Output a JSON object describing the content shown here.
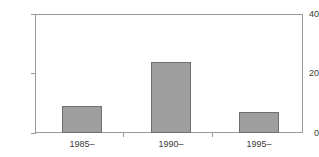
{
  "chart_data": {
    "type": "bar",
    "title": "",
    "subtitle": "",
    "xlabel": "",
    "ylabel": "",
    "categories": [
      "1985–",
      "1990–",
      "1995–"
    ],
    "values": [
      9,
      24,
      7
    ],
    "ylim": [
      0,
      40
    ],
    "yticks": [
      0,
      20,
      40
    ],
    "ytick_labels": [
      "0",
      "20",
      "40"
    ],
    "grid": false,
    "legend": null,
    "legend_position": "none",
    "series": [
      {
        "name": "",
        "values": [
          9,
          24,
          7
        ]
      }
    ],
    "colors": {
      "bar_fill": "#9e9e9e",
      "bar_edge": "#6f6f6f",
      "axis": "#9a9a9a",
      "text": "#3a3a3a",
      "background": "#ffffff"
    }
  },
  "axes": {
    "y_ticks": [
      {
        "label": "40",
        "value": 40
      },
      {
        "label": "20",
        "value": 20
      },
      {
        "label": "0",
        "value": 0
      }
    ],
    "x_ticks": [
      {
        "label": "1985–"
      },
      {
        "label": "1990–"
      },
      {
        "label": "1995–"
      }
    ]
  }
}
